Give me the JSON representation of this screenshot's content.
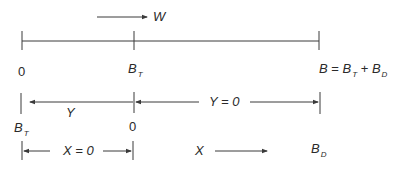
{
  "diagram": {
    "top_arrow": {
      "label": "W"
    },
    "top_line_labels": {
      "start": "0",
      "mid": {
        "main": "B",
        "sub": "T"
      },
      "end": {
        "lhs": "B",
        "eq": " = ",
        "t1": "B",
        "t1_sub": "T",
        "plus": " + ",
        "t2": "B",
        "t2_sub": "D"
      }
    },
    "row2": {
      "left_arrow_label": "Y",
      "right_arrow_label": "Y = 0",
      "left_tick_label": {
        "main": "B",
        "sub": "T"
      },
      "mid_tick_label": "0"
    },
    "row3": {
      "bracket_label": "X = 0",
      "arrow_label": "X",
      "end_label": {
        "main": "B",
        "sub": "D"
      }
    },
    "colors": {
      "line": "#3a3a3a",
      "text": "#2a2a2a",
      "background": "#ffffff"
    }
  }
}
